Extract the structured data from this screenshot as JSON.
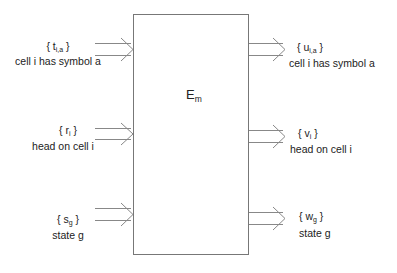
{
  "box": {
    "name": "E",
    "subscript": "m"
  },
  "inputs": [
    {
      "var": "t",
      "sub": "i,a",
      "desc": "cell i has symbol a"
    },
    {
      "var": "r",
      "sub": "i",
      "desc": "head on cell i"
    },
    {
      "var": "s",
      "sub": "g",
      "desc": "state g"
    }
  ],
  "outputs": [
    {
      "var": "u",
      "sub": "i,a",
      "desc": "cell i has symbol a"
    },
    {
      "var": "v",
      "sub": "i",
      "desc": "head on cell i"
    },
    {
      "var": "w",
      "sub": "g",
      "desc": "state g"
    }
  ],
  "colors": {
    "stroke": "#777777",
    "text": "#222222"
  }
}
